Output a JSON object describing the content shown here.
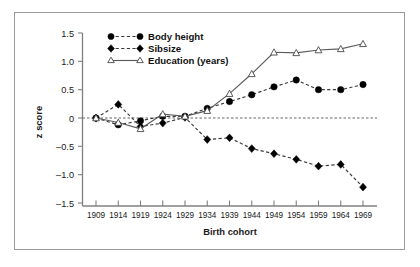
{
  "figure": {
    "background_color": "#ffffff",
    "frame_color": "#9a9a9a"
  },
  "chart_data": {
    "type": "line",
    "title": "",
    "xlabel": "Birth cohort",
    "ylabel": "z score",
    "categories": [
      "1909",
      "1914",
      "1919",
      "1924",
      "1929",
      "1934",
      "1939",
      "1944",
      "1949",
      "1954",
      "1959",
      "1964",
      "1969"
    ],
    "x": [
      1909,
      1914,
      1919,
      1924,
      1929,
      1934,
      1939,
      1944,
      1949,
      1954,
      1959,
      1964,
      1969
    ],
    "ylim": [
      -1.5,
      1.5
    ],
    "yticks": [
      1.5,
      1.0,
      0.5,
      0,
      -0.5,
      -1.0,
      -1.5
    ],
    "ytick_labels": [
      "1.5",
      "1.0",
      "0.5",
      "0",
      "–0.5",
      "–1.0",
      "–1.5"
    ],
    "grid": false,
    "zero_reference_line": 0,
    "legend_position": "top-left",
    "series": [
      {
        "name": "Body height",
        "marker": "filled-circle",
        "linestyle": "dashed",
        "color": "#000000",
        "values": [
          0.0,
          -0.12,
          -0.05,
          0.03,
          0.03,
          0.17,
          0.29,
          0.41,
          0.55,
          0.67,
          0.5,
          0.5,
          0.59
        ]
      },
      {
        "name": "Sibsize",
        "marker": "filled-diamond",
        "linestyle": "dashed",
        "color": "#000000",
        "values": [
          0.0,
          0.24,
          -0.15,
          -0.09,
          0.01,
          -0.38,
          -0.35,
          -0.54,
          -0.63,
          -0.73,
          -0.85,
          -0.82,
          -1.22
        ]
      },
      {
        "name": "Education (years)",
        "marker": "open-triangle",
        "linestyle": "solid",
        "color": "#4a4a4a",
        "values": [
          0.0,
          -0.08,
          -0.19,
          0.07,
          0.03,
          0.13,
          0.43,
          0.78,
          1.16,
          1.15,
          1.2,
          1.22,
          1.31
        ]
      }
    ]
  },
  "legend": {
    "items": [
      {
        "label": "Body height"
      },
      {
        "label": "Sibsize"
      },
      {
        "label": "Education (years)"
      }
    ]
  }
}
